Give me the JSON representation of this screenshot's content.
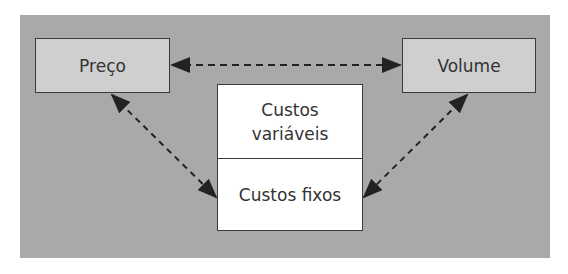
{
  "diagram": {
    "nodes": {
      "preco": {
        "label": "Preço"
      },
      "volume": {
        "label": "Volume"
      },
      "costs": {
        "variable": {
          "line1": "Custos",
          "line2": "variáveis"
        },
        "fixed": {
          "label": "Custos fixos"
        }
      }
    },
    "edges": [
      {
        "from": "Preço",
        "to": "Volume",
        "style": "dashed",
        "direction": "both"
      },
      {
        "from": "Preço",
        "to": "Custos fixos",
        "style": "dashed",
        "direction": "both"
      },
      {
        "from": "Volume",
        "to": "Custos fixos",
        "style": "dashed",
        "direction": "both"
      }
    ],
    "colors": {
      "background": "#a9a9a9",
      "node_fill": "#cfcfcf",
      "cost_fill": "#ffffff",
      "stroke": "#3a3a3a"
    }
  }
}
